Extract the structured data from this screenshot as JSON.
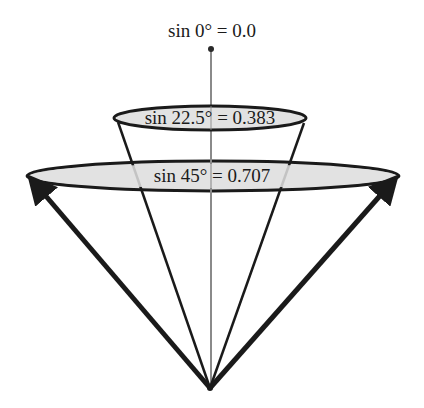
{
  "diagram": {
    "labels": {
      "top": "sin 0° = 0.0",
      "middle": "sin 22.5° = 0.383",
      "bottom": "sin 45° = 0.707"
    },
    "elements": {
      "apex": {
        "x": 210,
        "y": 388
      },
      "axis_top": {
        "x": 211,
        "y": 49
      },
      "small_ellipse": {
        "cx": 210,
        "cy": 118,
        "rx": 96,
        "ry": 12,
        "angle_deg": 22.5,
        "value": 0.383
      },
      "large_ellipse": {
        "cx": 213,
        "cy": 176,
        "rx": 186,
        "ry": 15,
        "angle_deg": 45,
        "value": 0.707
      },
      "axis_value": {
        "angle_deg": 0,
        "value": 0.0
      }
    },
    "colors": {
      "stroke": "#1a1a1a",
      "ellipse_fill": "#e2e2e2",
      "axis": "#8a8a8a"
    }
  }
}
